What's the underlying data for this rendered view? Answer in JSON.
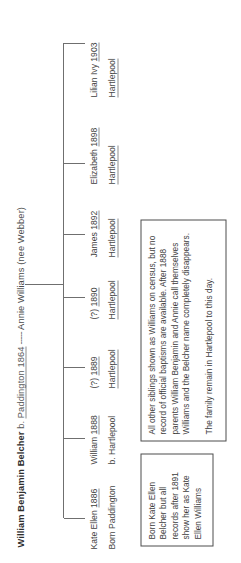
{
  "chart": {
    "type": "family-tree",
    "orientation": "rotated-90-ccw",
    "parents": {
      "father_name": "William Benjamin Belcher",
      "father_birth_label": " b. ",
      "father_birth_place_year": "Paddington 1864",
      "union_mark": "-----",
      "mother_name": "Annie Williams (nee Webber)"
    },
    "children": [
      {
        "name": "Kate Ellen",
        "year": "1886",
        "place_prefix": "Born ",
        "place": "Paddington",
        "place_underlined": false
      },
      {
        "name": "William",
        "year": "1888",
        "place_prefix": "b. ",
        "place": "Hartlepool",
        "place_underlined": false
      },
      {
        "name": "(?)",
        "year": "1889",
        "place_prefix": "",
        "place": "Hartlepool",
        "place_underlined": true
      },
      {
        "name": "(?)",
        "year": "1890",
        "place_prefix": "",
        "place": "Hartlepool",
        "place_underlined": true
      },
      {
        "name": "James",
        "year": "1892",
        "place_prefix": "",
        "place": "Hartlepool",
        "place_underlined": true
      },
      {
        "name": "Elizabeth",
        "year": "1898",
        "place_prefix": "",
        "place": "Hartlepool",
        "place_underlined": true
      },
      {
        "name": "Lilian Ivy",
        "year": "1903",
        "place_prefix": "",
        "place": "Hartlepool",
        "place_underlined": true
      }
    ],
    "notes": [
      {
        "id": "kate-note",
        "paragraphs": [
          "Born Kate Ellen Belcher but all records after 1891 show her as Kate Ellen Williams"
        ]
      },
      {
        "id": "general-note",
        "paragraphs": [
          "All other siblings shown as Williams on census, but no record of official baptisms are available. After 1888 parents William Benjamin and Annie call themselves Williams and the Belcher name completely disappears.",
          "The family remain in Hartlepool to this day."
        ]
      }
    ],
    "colors": {
      "text": "#3d3d3d",
      "line": "#6f6f6f",
      "box_border": "#4c4c4c",
      "background": "#ffffff"
    }
  }
}
